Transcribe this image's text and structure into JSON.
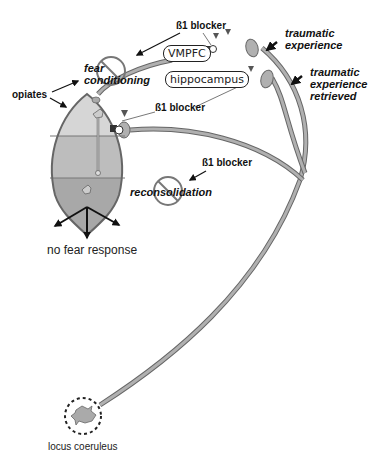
{
  "diagram": {
    "regions": {
      "vmpfc": "VMPFC",
      "hippocampus": "hippocampus",
      "locus_coeruleus": "locus coeruleus"
    },
    "processes": {
      "fear_conditioning": "fear conditioning",
      "reconsolidation": "reconsolidation"
    },
    "labels": {
      "opiates": "opiates",
      "beta_blocker_top": "ß1 blocker",
      "beta_blocker_middle": "ß1 blocker",
      "beta_blocker_reconsolidation": "ß1 blocker",
      "traumatic_experience": "traumatic experience",
      "traumatic_experience_line1": "traumatic",
      "traumatic_experience_line2": "experience",
      "traumatic_retrieved_line1": "traumatic",
      "traumatic_retrieved_line2": "experience",
      "traumatic_retrieved_line3": "retrieved",
      "outcome": "no fear response"
    },
    "colors": {
      "fiber": "#aaaaaa",
      "fiber_outline": "#666666",
      "amygdala_top": "#d4d4d4",
      "amygdala_mid": "#bdbdbd",
      "amygdala_bottom": "#a8a8a8",
      "prohibit": "#777777",
      "arrow": "#111111"
    }
  }
}
